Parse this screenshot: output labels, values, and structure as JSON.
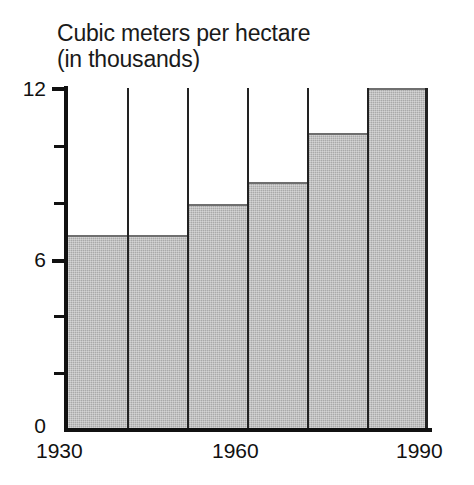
{
  "chart_data": {
    "type": "bar",
    "title": "Cubic meters per hectare (in thousands)",
    "title_line1": "Cubic meters per hectare",
    "title_line2": "(in thousands)",
    "xlabel": "",
    "ylabel": "",
    "categories": [
      "1930",
      "1940",
      "1950",
      "1960",
      "1970",
      "1980"
    ],
    "x_axis_start": "1930",
    "x_axis_end": "1990",
    "values": [
      6.8,
      6.8,
      7.9,
      8.7,
      10.4,
      12.0
    ],
    "ylim": [
      0,
      12
    ],
    "xlim": [
      1930,
      1990
    ],
    "y_tick_labels": [
      "12",
      "6",
      "0"
    ],
    "y_tick_values": [
      12,
      6,
      0
    ],
    "y_minor_tick_values": [
      10,
      8,
      4,
      2
    ],
    "x_tick_labels": [
      "1930",
      "1960",
      "1990"
    ],
    "x_tick_values": [
      1930,
      1960,
      1990
    ],
    "grid": false,
    "legend": null,
    "bar_fill_color": "#a9a9a9",
    "bar_edge_color": "#222222",
    "axis_color": "#111111",
    "background_color": "#ffffff",
    "bars": [
      {
        "label": "1930",
        "value": 6.8
      },
      {
        "label": "1940",
        "value": 6.8
      },
      {
        "label": "1950",
        "value": 7.9
      },
      {
        "label": "1960",
        "value": 8.7
      },
      {
        "label": "1970",
        "value": 10.4
      },
      {
        "label": "1980",
        "value": 12.0
      }
    ]
  }
}
